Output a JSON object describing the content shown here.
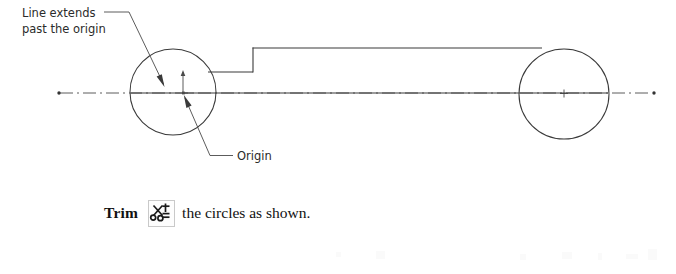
{
  "figure": {
    "annotations": [
      {
        "id": "line-extends",
        "name": "line-extends-callout",
        "line1": "Line extends",
        "line2": "past the origin"
      },
      {
        "id": "origin",
        "name": "origin-callout",
        "label": "Origin"
      }
    ],
    "geometry": {
      "left_circle": {
        "cx": 173,
        "cy": 92,
        "r": 43
      },
      "right_circle": {
        "cx": 564,
        "cy": 94,
        "r": 45
      },
      "centerline_y": 93,
      "centerline_start_x": 58,
      "centerline_end_x": 655,
      "top_profile_y": 48,
      "step_shoulder_y": 72,
      "step_x": 253
    },
    "colors": {
      "line": "#3a3a3a",
      "centerline": "#4a4a4a",
      "text": "#2b2b2b",
      "caption_text": "#111111",
      "background": "#ffffff",
      "icon_border": "#c9c9c9"
    }
  },
  "caption": {
    "command_label": "Trim",
    "icon_name": "trim-scissors-icon",
    "rest_text": "the circles as shown."
  }
}
